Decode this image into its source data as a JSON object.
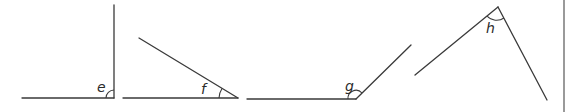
{
  "diagram": {
    "title": "",
    "angles": [
      {
        "label": "e",
        "type": "right-angle-like (vertical + horizontal)"
      },
      {
        "label": "f",
        "type": "acute"
      },
      {
        "label": "g",
        "type": "obtuse"
      },
      {
        "label": "h",
        "type": "acute (apex at top)"
      }
    ],
    "colors": {
      "line": "#3a3a3a",
      "background": "#ffffff",
      "edge": "#9a9a9a"
    }
  }
}
